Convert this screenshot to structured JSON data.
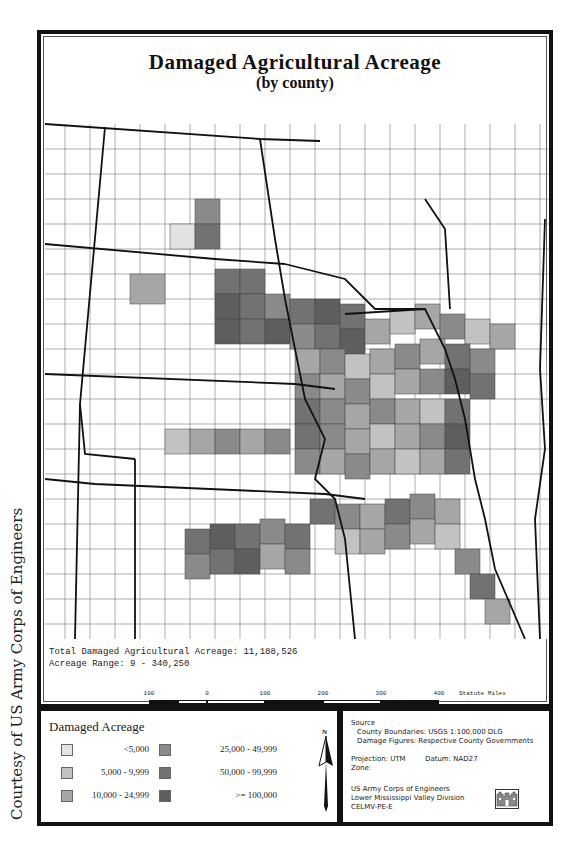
{
  "credit": "Courtesy of US Army Corps of Engineers",
  "map": {
    "title": "Damaged Agricultural Acreage",
    "subtitle": "(by county)",
    "total_line": "Total Damaged Agricultural Acreage: 11,188,526",
    "range_line": "Acreage Range: 9 - 340,250",
    "scale": {
      "labels": [
        "100",
        "0",
        "100",
        "200",
        "300",
        "400"
      ],
      "units": "Statute Miles"
    }
  },
  "legend": {
    "title": "Damaged Acreage",
    "items": [
      {
        "label": "<5,000",
        "color": "#e2e2e2"
      },
      {
        "label": "5,000  -   9,999",
        "color": "#c2c2c2"
      },
      {
        "label": "10,000  -  24,999",
        "color": "#a6a6a6"
      },
      {
        "label": "25,000  -   49,999",
        "color": "#8a8a8a"
      },
      {
        "label": "50,000  -   99,999",
        "color": "#727272"
      },
      {
        "label": ">= 100,000",
        "color": "#5e5e5e"
      }
    ],
    "north_label": "N"
  },
  "info": {
    "source_header": "Source",
    "county_boundaries": "County Boundaries:   USGS  1:100,000  DLG",
    "damage_figures": "Damage Figures:   Respective County Governments",
    "projection": "Projection:   UTM",
    "datum": "Datum:  NAD27",
    "zone": "Zone:",
    "org1": "US Army Corps of Engineers",
    "org2": "Lower Mississippi Valley Division",
    "org3": "CELMV-PE-E"
  }
}
